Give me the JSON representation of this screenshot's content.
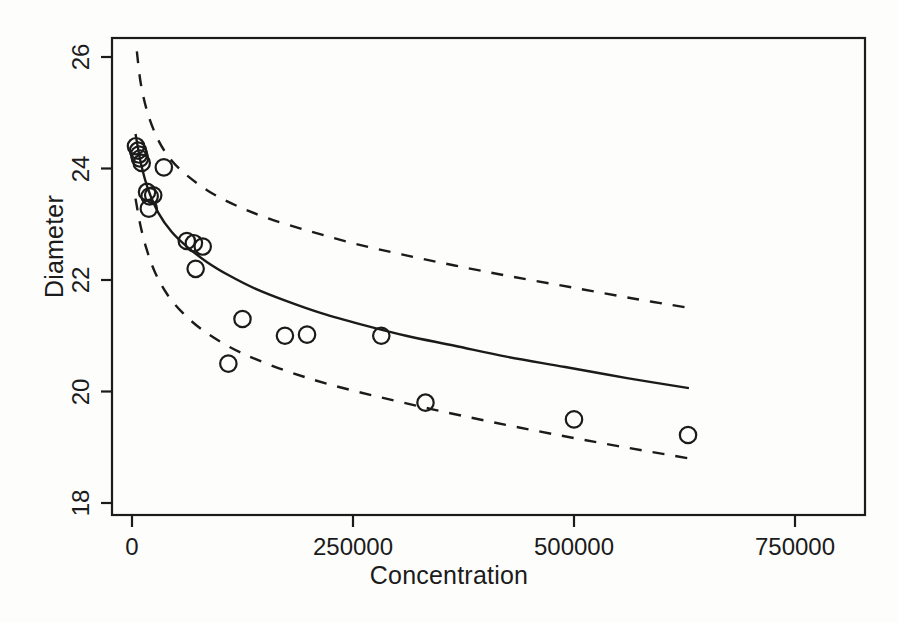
{
  "chart_data": {
    "type": "scatter",
    "title": "",
    "xlabel": "Concentration",
    "ylabel": "Diameter",
    "xlim": [
      -30000,
      830000
    ],
    "ylim": [
      17.45,
      26.35
    ],
    "xticks": [
      0,
      250000,
      500000,
      750000
    ],
    "xtick_labels": [
      "0",
      "250000",
      "500000",
      "750000"
    ],
    "yticks": [
      18,
      20,
      22,
      24,
      26
    ],
    "ytick_labels": [
      "18",
      "20",
      "22",
      "24",
      "26"
    ],
    "grid": false,
    "legend": null,
    "marker": "open-circle",
    "points": [
      {
        "x": 4500,
        "y": 24.4
      },
      {
        "x": 6800,
        "y": 24.32
      },
      {
        "x": 8000,
        "y": 24.25
      },
      {
        "x": 9000,
        "y": 24.18
      },
      {
        "x": 11000,
        "y": 24.1
      },
      {
        "x": 36000,
        "y": 24.02
      },
      {
        "x": 17000,
        "y": 23.58
      },
      {
        "x": 20000,
        "y": 23.5
      },
      {
        "x": 24000,
        "y": 23.52
      },
      {
        "x": 19000,
        "y": 23.28
      },
      {
        "x": 62000,
        "y": 22.7
      },
      {
        "x": 70000,
        "y": 22.66
      },
      {
        "x": 80000,
        "y": 22.6
      },
      {
        "x": 72000,
        "y": 22.2
      },
      {
        "x": 125000,
        "y": 21.3
      },
      {
        "x": 173000,
        "y": 21.0
      },
      {
        "x": 198000,
        "y": 21.02
      },
      {
        "x": 282000,
        "y": 21.0
      },
      {
        "x": 109000,
        "y": 20.5
      },
      {
        "x": 332000,
        "y": 19.8
      },
      {
        "x": 500000,
        "y": 19.5
      },
      {
        "x": 629000,
        "y": 19.22
      }
    ],
    "fit_curve": {
      "style": "solid",
      "label": "fitted model",
      "points": [
        {
          "x": 4000,
          "y": 24.62
        },
        {
          "x": 10000,
          "y": 24.1
        },
        {
          "x": 18000,
          "y": 23.64
        },
        {
          "x": 30000,
          "y": 23.2
        },
        {
          "x": 45000,
          "y": 22.86
        },
        {
          "x": 62000,
          "y": 22.6
        },
        {
          "x": 85000,
          "y": 22.32
        },
        {
          "x": 110000,
          "y": 22.08
        },
        {
          "x": 140000,
          "y": 21.84
        },
        {
          "x": 175000,
          "y": 21.62
        },
        {
          "x": 215000,
          "y": 21.4
        },
        {
          "x": 260000,
          "y": 21.2
        },
        {
          "x": 310000,
          "y": 21.0
        },
        {
          "x": 365000,
          "y": 20.82
        },
        {
          "x": 425000,
          "y": 20.62
        },
        {
          "x": 490000,
          "y": 20.44
        },
        {
          "x": 560000,
          "y": 20.24
        },
        {
          "x": 630000,
          "y": 20.06
        }
      ]
    },
    "confidence_bands": [
      {
        "style": "dashed",
        "label": "upper confidence band",
        "points": [
          {
            "x": 5500,
            "y": 26.1
          },
          {
            "x": 10000,
            "y": 25.52
          },
          {
            "x": 18000,
            "y": 24.98
          },
          {
            "x": 30000,
            "y": 24.5
          },
          {
            "x": 45000,
            "y": 24.14
          },
          {
            "x": 65000,
            "y": 23.84
          },
          {
            "x": 90000,
            "y": 23.56
          },
          {
            "x": 120000,
            "y": 23.32
          },
          {
            "x": 155000,
            "y": 23.1
          },
          {
            "x": 200000,
            "y": 22.88
          },
          {
            "x": 250000,
            "y": 22.66
          },
          {
            "x": 305000,
            "y": 22.46
          },
          {
            "x": 365000,
            "y": 22.26
          },
          {
            "x": 430000,
            "y": 22.06
          },
          {
            "x": 500000,
            "y": 21.86
          },
          {
            "x": 570000,
            "y": 21.66
          },
          {
            "x": 630000,
            "y": 21.5
          }
        ]
      },
      {
        "style": "dashed",
        "label": "lower confidence band",
        "points": [
          {
            "x": 4000,
            "y": 23.46
          },
          {
            "x": 9000,
            "y": 23.02
          },
          {
            "x": 16000,
            "y": 22.58
          },
          {
            "x": 26000,
            "y": 22.14
          },
          {
            "x": 40000,
            "y": 21.74
          },
          {
            "x": 58000,
            "y": 21.4
          },
          {
            "x": 80000,
            "y": 21.1
          },
          {
            "x": 108000,
            "y": 20.82
          },
          {
            "x": 140000,
            "y": 20.58
          },
          {
            "x": 180000,
            "y": 20.34
          },
          {
            "x": 225000,
            "y": 20.12
          },
          {
            "x": 280000,
            "y": 19.9
          },
          {
            "x": 340000,
            "y": 19.68
          },
          {
            "x": 405000,
            "y": 19.46
          },
          {
            "x": 475000,
            "y": 19.24
          },
          {
            "x": 550000,
            "y": 19.02
          },
          {
            "x": 630000,
            "y": 18.8
          }
        ]
      }
    ]
  },
  "axes": {
    "x_title": "Concentration",
    "y_title": "Diameter"
  },
  "colors": {
    "line": "#1b1b1b",
    "marker_stroke": "#1b1b1b",
    "background": "#fdfdfc",
    "text": "#1b1b1b"
  }
}
